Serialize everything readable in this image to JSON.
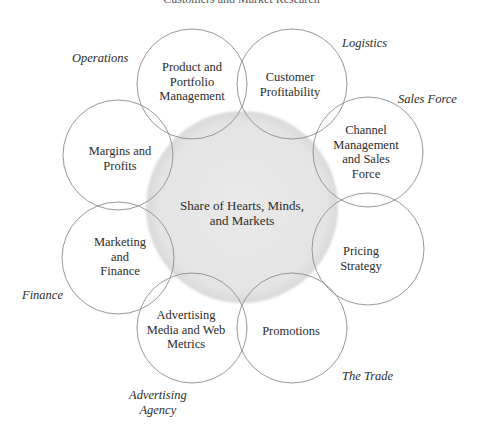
{
  "diagram": {
    "top_caption_cut_off": "Customers and Market Research",
    "center": {
      "lines": [
        "Share of Hearts, Minds,",
        "and Markets"
      ],
      "fill_color": "#e6e6e6"
    },
    "circles": [
      {
        "id": "product-portfolio",
        "lines": [
          "Product and",
          "Portfolio",
          "Management"
        ]
      },
      {
        "id": "customer-profitability",
        "lines": [
          "Customer",
          "Profitability"
        ]
      },
      {
        "id": "channel-management",
        "lines": [
          "Channel",
          "Management",
          "and Sales",
          "Force"
        ]
      },
      {
        "id": "pricing-strategy",
        "lines": [
          "Pricing",
          "Strategy"
        ]
      },
      {
        "id": "promotions",
        "lines": [
          "Promotions"
        ]
      },
      {
        "id": "advertising-media",
        "lines": [
          "Advertising",
          "Media and Web",
          "Metrics"
        ]
      },
      {
        "id": "marketing-finance",
        "lines": [
          "Marketing",
          "and",
          "Finance"
        ]
      },
      {
        "id": "margins-profits",
        "lines": [
          "Margins and",
          "Profits"
        ]
      }
    ],
    "stakeholders": [
      {
        "id": "operations",
        "lines": [
          "Operations"
        ]
      },
      {
        "id": "logistics",
        "lines": [
          "Logistics"
        ]
      },
      {
        "id": "sales-force",
        "lines": [
          "Sales Force"
        ]
      },
      {
        "id": "finance",
        "lines": [
          "Finance"
        ]
      },
      {
        "id": "the-trade",
        "lines": [
          "The Trade"
        ]
      },
      {
        "id": "advertising-agency",
        "lines": [
          "Advertising",
          "Agency"
        ]
      }
    ],
    "colors": {
      "circle_stroke": "#8c8c8c",
      "center_fill": "#e6e6e6",
      "text": "#2b2b2b"
    }
  }
}
